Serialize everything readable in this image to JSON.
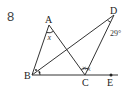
{
  "problem_number": "8",
  "points": {
    "A": {
      "label": "A",
      "x": 49,
      "y": 25
    },
    "B": {
      "label": "B",
      "x": 32,
      "y": 75
    },
    "C": {
      "label": "C",
      "x": 85,
      "y": 75
    },
    "D": {
      "label": "D",
      "x": 114,
      "y": 15
    },
    "E": {
      "label": "E",
      "x": 111,
      "y": 75
    }
  },
  "angles": {
    "x_label": "x",
    "d_label": "29°",
    "b_marks": "• •",
    "c_marks": "× ×"
  },
  "colors": {
    "line": "#333333",
    "text": "#222222"
  }
}
